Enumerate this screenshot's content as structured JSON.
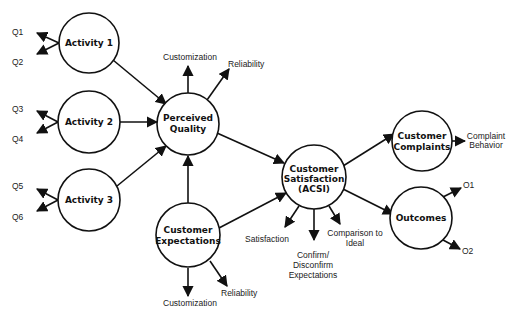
{
  "diagram": {
    "type": "structural-equation-model",
    "nodes": {
      "activity1": {
        "lines": [
          "Activity 1"
        ]
      },
      "activity2": {
        "lines": [
          "Activity 2"
        ]
      },
      "activity3": {
        "lines": [
          "Activity 3"
        ]
      },
      "perceived_quality": {
        "lines": [
          "Perceived",
          "Quality"
        ]
      },
      "customer_expectations": {
        "lines": [
          "Customer",
          "Expectations"
        ]
      },
      "customer_satisfaction": {
        "lines": [
          "Customer",
          "Satisfaction",
          "(ACSI)"
        ]
      },
      "customer_complaints": {
        "lines": [
          "Customer",
          "Complaints"
        ]
      },
      "outcomes": {
        "lines": [
          "Outcomes"
        ]
      }
    },
    "indicators": {
      "q1": "Q1",
      "q2": "Q2",
      "q3": "Q3",
      "q4": "Q4",
      "q5": "Q5",
      "q6": "Q6",
      "pq_customization": "Customization",
      "pq_reliability": "Reliability",
      "ce_customization": "Customization",
      "ce_reliability": "Reliability",
      "cs_satisfaction": "Satisfaction",
      "cs_confirm": [
        "Confirm/",
        "Disconfirm",
        "Expectations"
      ],
      "cs_comparison": [
        "Comparison to",
        "Ideal"
      ],
      "cc_complaint_behavior": [
        "Complaint",
        "Behavior"
      ],
      "o1": "O1",
      "o2": "O2"
    },
    "edges": [
      {
        "from": "Activity 1",
        "to": "Perceived Quality"
      },
      {
        "from": "Activity 2",
        "to": "Perceived Quality"
      },
      {
        "from": "Activity 3",
        "to": "Perceived Quality"
      },
      {
        "from": "Customer Expectations",
        "to": "Perceived Quality"
      },
      {
        "from": "Perceived Quality",
        "to": "Customer Satisfaction (ACSI)"
      },
      {
        "from": "Customer Expectations",
        "to": "Customer Satisfaction (ACSI)"
      },
      {
        "from": "Customer Satisfaction (ACSI)",
        "to": "Customer Complaints"
      },
      {
        "from": "Customer Satisfaction (ACSI)",
        "to": "Outcomes"
      }
    ]
  }
}
